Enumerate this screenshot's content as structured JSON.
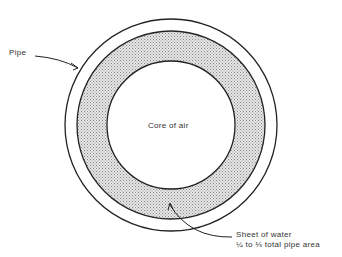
{
  "diagram": {
    "labels": {
      "pipe": "Pipe",
      "core": "Core of air",
      "water_line1": "Sheet of water",
      "water_line2": "¼ to ⅓ total pipe area"
    },
    "geometry": {
      "center": [
        171,
        125
      ],
      "outer_radius": 106,
      "water_outer_radius": 94,
      "core_radius": 64
    },
    "colors": {
      "stroke": "#222222",
      "water_fill": "#cfcfcf",
      "background": "#ffffff"
    }
  }
}
